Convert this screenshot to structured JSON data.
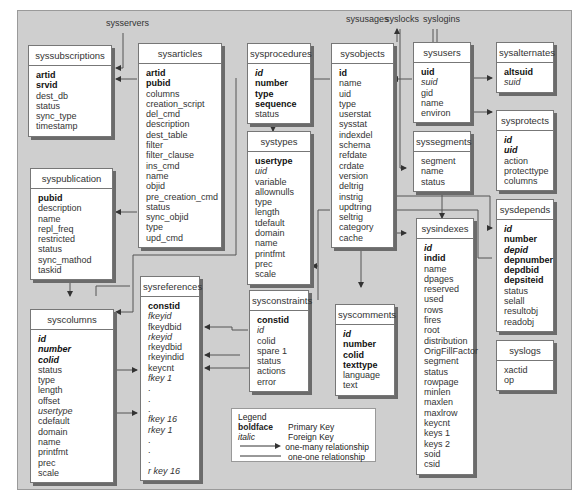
{
  "external_tables": [
    {
      "name": "sysservers",
      "x": 100,
      "y": 23
    },
    {
      "name": "sysusages",
      "x": 343,
      "y": 17
    },
    {
      "name": "syslocks",
      "x": 385,
      "y": 17
    },
    {
      "name": "syslogins",
      "x": 430,
      "y": 17
    }
  ],
  "tables": {
    "syssubscriptions": {
      "title": "syssubscriptions",
      "rows": [
        {
          "t": "artid",
          "k": "pk"
        },
        {
          "t": "srvid",
          "k": "pk"
        },
        {
          "t": "dest_db",
          "k": ""
        },
        {
          "t": "status",
          "k": ""
        },
        {
          "t": "sync_type",
          "k": ""
        },
        {
          "t": "timestamp",
          "k": ""
        }
      ]
    },
    "sysarticles": {
      "title": "sysarticles",
      "rows": [
        {
          "t": "artid",
          "k": "pk"
        },
        {
          "t": "pubid",
          "k": "pk"
        },
        {
          "t": "columns",
          "k": ""
        },
        {
          "t": "creation_script",
          "k": ""
        },
        {
          "t": "del_cmd",
          "k": ""
        },
        {
          "t": "description",
          "k": ""
        },
        {
          "t": "dest_table",
          "k": ""
        },
        {
          "t": "filter",
          "k": ""
        },
        {
          "t": "filter_clause",
          "k": ""
        },
        {
          "t": "ins_cmd",
          "k": ""
        },
        {
          "t": "name",
          "k": ""
        },
        {
          "t": "objid",
          "k": ""
        },
        {
          "t": "pre_creation_cmd",
          "k": ""
        },
        {
          "t": "status",
          "k": ""
        },
        {
          "t": "sync_objid",
          "k": ""
        },
        {
          "t": "type",
          "k": ""
        },
        {
          "t": "upd_cmd",
          "k": ""
        }
      ]
    },
    "sysprocedures": {
      "title": "sysprocedures",
      "rows": [
        {
          "t": "id",
          "k": "pkfk"
        },
        {
          "t": "number",
          "k": "pk"
        },
        {
          "t": "type",
          "k": "pk"
        },
        {
          "t": "sequence",
          "k": "pk"
        },
        {
          "t": "status",
          "k": ""
        }
      ]
    },
    "sysobjects": {
      "title": "sysobjects",
      "rows": [
        {
          "t": "id",
          "k": "pk"
        },
        {
          "t": "name",
          "k": ""
        },
        {
          "t": "uid",
          "k": ""
        },
        {
          "t": "type",
          "k": ""
        },
        {
          "t": "userstat",
          "k": ""
        },
        {
          "t": "sysstat",
          "k": ""
        },
        {
          "t": "indexdel",
          "k": ""
        },
        {
          "t": "schema",
          "k": ""
        },
        {
          "t": "refdate",
          "k": ""
        },
        {
          "t": "crdate",
          "k": ""
        },
        {
          "t": "version",
          "k": ""
        },
        {
          "t": "deltrig",
          "k": ""
        },
        {
          "t": "instrig",
          "k": ""
        },
        {
          "t": "updtring",
          "k": ""
        },
        {
          "t": "seltrig",
          "k": ""
        },
        {
          "t": "category",
          "k": ""
        },
        {
          "t": "cache",
          "k": ""
        }
      ]
    },
    "sysusers": {
      "title": "sysusers",
      "rows": [
        {
          "t": "uid",
          "k": "pk"
        },
        {
          "t": "suid",
          "k": "fk"
        },
        {
          "t": "gid",
          "k": ""
        },
        {
          "t": "name",
          "k": ""
        },
        {
          "t": "environ",
          "k": ""
        }
      ]
    },
    "sysalternates": {
      "title": "sysalternates",
      "rows": [
        {
          "t": "altsuid",
          "k": "pk"
        },
        {
          "t": "suid",
          "k": "fk"
        }
      ]
    },
    "sysprotects": {
      "title": "sysprotects",
      "rows": [
        {
          "t": "id",
          "k": "pkfk"
        },
        {
          "t": "uid",
          "k": "pkfk"
        },
        {
          "t": "action",
          "k": ""
        },
        {
          "t": "protecttype",
          "k": ""
        },
        {
          "t": "columns",
          "k": ""
        }
      ]
    },
    "syssegments": {
      "title": "syssegments",
      "rows": [
        {
          "t": "segment",
          "k": ""
        },
        {
          "t": "name",
          "k": ""
        },
        {
          "t": "status",
          "k": ""
        }
      ]
    },
    "systypes": {
      "title": "systypes",
      "rows": [
        {
          "t": "usertype",
          "k": "pk"
        },
        {
          "t": "uid",
          "k": "fk"
        },
        {
          "t": "variable",
          "k": ""
        },
        {
          "t": "allownulls",
          "k": ""
        },
        {
          "t": "type",
          "k": ""
        },
        {
          "t": "length",
          "k": ""
        },
        {
          "t": "tdefault",
          "k": ""
        },
        {
          "t": "domain",
          "k": ""
        },
        {
          "t": "name",
          "k": ""
        },
        {
          "t": "printfmt",
          "k": ""
        },
        {
          "t": "prec",
          "k": ""
        },
        {
          "t": "scale",
          "k": ""
        }
      ]
    },
    "syspublication": {
      "title": "syspublication",
      "rows": [
        {
          "t": "pubid",
          "k": "pk"
        },
        {
          "t": "description",
          "k": ""
        },
        {
          "t": "name",
          "k": ""
        },
        {
          "t": "repl_freq",
          "k": ""
        },
        {
          "t": "restricted",
          "k": ""
        },
        {
          "t": "status",
          "k": ""
        },
        {
          "t": "sync_mathod",
          "k": ""
        },
        {
          "t": "taskid",
          "k": ""
        }
      ]
    },
    "sysdepends": {
      "title": "sysdepends",
      "rows": [
        {
          "t": "id",
          "k": "pkfk"
        },
        {
          "t": "number",
          "k": "pk"
        },
        {
          "t": "depid",
          "k": "pkfk"
        },
        {
          "t": "depnumber",
          "k": "pk"
        },
        {
          "t": "depdbid",
          "k": "pk"
        },
        {
          "t": "depsiteid",
          "k": "pk"
        },
        {
          "t": "status",
          "k": ""
        },
        {
          "t": "selall",
          "k": ""
        },
        {
          "t": "resultobj",
          "k": ""
        },
        {
          "t": "readobj",
          "k": ""
        }
      ]
    },
    "sysindexes": {
      "title": "sysindexes",
      "rows": [
        {
          "t": "id",
          "k": "pkfk"
        },
        {
          "t": "indid",
          "k": "pk"
        },
        {
          "t": "name",
          "k": ""
        },
        {
          "t": "dpages",
          "k": ""
        },
        {
          "t": "reserved",
          "k": ""
        },
        {
          "t": "used",
          "k": ""
        },
        {
          "t": "rows",
          "k": ""
        },
        {
          "t": "fires",
          "k": ""
        },
        {
          "t": "root",
          "k": ""
        },
        {
          "t": "distribution",
          "k": ""
        },
        {
          "t": "OrigFillFactor",
          "k": ""
        },
        {
          "t": "segment",
          "k": ""
        },
        {
          "t": "status",
          "k": ""
        },
        {
          "t": "rowpage",
          "k": ""
        },
        {
          "t": "minlen",
          "k": ""
        },
        {
          "t": "maxlen",
          "k": ""
        },
        {
          "t": "maxlrow",
          "k": ""
        },
        {
          "t": "keycnt",
          "k": ""
        },
        {
          "t": "keys 1",
          "k": ""
        },
        {
          "t": "keys 2",
          "k": ""
        },
        {
          "t": "soid",
          "k": ""
        },
        {
          "t": "csid",
          "k": ""
        }
      ]
    },
    "sysreferences": {
      "title": "sysreferences",
      "rows": [
        {
          "t": "constid",
          "k": "pk"
        },
        {
          "t": "fkeyid",
          "k": "fk"
        },
        {
          "t": "fkeydbid",
          "k": ""
        },
        {
          "t": "rkeyid",
          "k": "fk"
        },
        {
          "t": "rkeydbid",
          "k": ""
        },
        {
          "t": "rkeyindid",
          "k": ""
        },
        {
          "t": "keycnt",
          "k": ""
        },
        {
          "t": "fkey 1",
          "k": "fk"
        },
        {
          "t": ".",
          "k": ""
        },
        {
          "t": ".",
          "k": ""
        },
        {
          "t": ".",
          "k": ""
        },
        {
          "t": "fkey 16",
          "k": "fk"
        },
        {
          "t": "rkey 1",
          "k": "fk"
        },
        {
          "t": ".",
          "k": ""
        },
        {
          "t": ".",
          "k": ""
        },
        {
          "t": ".",
          "k": ""
        },
        {
          "t": "r key 16",
          "k": "fk"
        }
      ]
    },
    "sysconstraints": {
      "title": "sysconstraints",
      "rows": [
        {
          "t": "constid",
          "k": "pk"
        },
        {
          "t": "id",
          "k": "fk"
        },
        {
          "t": "colid",
          "k": ""
        },
        {
          "t": "spare 1",
          "k": ""
        },
        {
          "t": "status",
          "k": ""
        },
        {
          "t": "actions",
          "k": ""
        },
        {
          "t": "error",
          "k": ""
        }
      ]
    },
    "syscomments": {
      "title": "syscomments",
      "rows": [
        {
          "t": "id",
          "k": "pkfk"
        },
        {
          "t": "number",
          "k": "pk"
        },
        {
          "t": "colid",
          "k": "pk"
        },
        {
          "t": "texttype",
          "k": "pk"
        },
        {
          "t": "language",
          "k": ""
        },
        {
          "t": "text",
          "k": ""
        }
      ]
    },
    "syscolumns": {
      "title": "syscolumns",
      "rows": [
        {
          "t": "id",
          "k": "pkfk"
        },
        {
          "t": "number",
          "k": "pkfk"
        },
        {
          "t": "colid",
          "k": "pkfk"
        },
        {
          "t": "status",
          "k": ""
        },
        {
          "t": "type",
          "k": ""
        },
        {
          "t": "length",
          "k": ""
        },
        {
          "t": "offset",
          "k": ""
        },
        {
          "t": "usertype",
          "k": "fk"
        },
        {
          "t": "cdefault",
          "k": ""
        },
        {
          "t": "domain",
          "k": ""
        },
        {
          "t": "name",
          "k": ""
        },
        {
          "t": "printfmt",
          "k": ""
        },
        {
          "t": "prec",
          "k": ""
        },
        {
          "t": "scale",
          "k": ""
        }
      ]
    },
    "syslogs": {
      "title": "syslogs",
      "rows": [
        {
          "t": "xactid",
          "k": ""
        },
        {
          "t": "op",
          "k": ""
        }
      ]
    }
  },
  "legend": {
    "title": "Legend",
    "items": [
      {
        "key": "boldface",
        "desc": "Primary Key",
        "style": "bold"
      },
      {
        "key": "italic",
        "desc": "Foreign Key",
        "style": "italic"
      },
      {
        "key": "arrow",
        "desc": "one-many relationship",
        "style": "arrow"
      },
      {
        "key": "line",
        "desc": "one-one relationship",
        "style": "line"
      }
    ]
  },
  "colors": {
    "background": "#cfcfcf",
    "table_bg": "#ffffff",
    "line": "#555555"
  }
}
